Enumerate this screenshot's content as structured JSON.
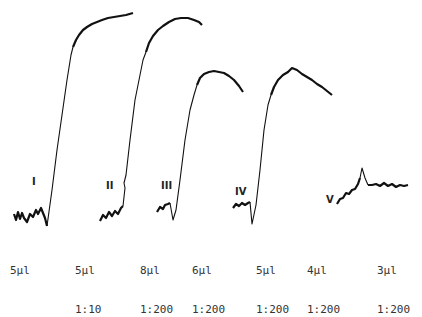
{
  "figure": {
    "traces": [
      {
        "id": "I",
        "label": "I",
        "volume": "5µl",
        "dilution": ""
      },
      {
        "id": "II",
        "label": "II",
        "volume": "5µl",
        "dilution": "1:10"
      },
      {
        "id": "III",
        "label": "III",
        "volume": "8µl",
        "dilution": "1:200"
      },
      {
        "id": "III-b",
        "label": "",
        "volume": "6µl",
        "dilution": "1:200"
      },
      {
        "id": "IV",
        "label": "IV",
        "volume": "5µl",
        "dilution": "1:200"
      },
      {
        "id": "IV-b",
        "label": "",
        "volume": "4µl",
        "dilution": "1:200"
      },
      {
        "id": "V",
        "label": "V",
        "volume": "3µl",
        "dilution": "1:200"
      }
    ],
    "stroke_color": "#111111",
    "background": "#ffffff"
  }
}
